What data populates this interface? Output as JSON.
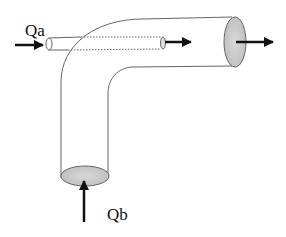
{
  "diagram": {
    "labels": {
      "inflow_a": "Qa",
      "inflow_b": "Qb"
    },
    "colors": {
      "line": "#555555",
      "end_fill": "#cfcfcf",
      "arrow": "#111111",
      "background": "#ffffff"
    },
    "elements": [
      {
        "id": "main-pipe",
        "type": "elbow-pipe",
        "description": "90-degree bend, vertical inlet at bottom, horizontal outlet at right"
      },
      {
        "id": "small-pipe",
        "type": "inner-pipe",
        "description": "thin pipe entering from left, passing through bend (dotted inside)"
      },
      {
        "id": "arrow-qa",
        "type": "arrow",
        "direction": "right",
        "label": "Qa"
      },
      {
        "id": "arrow-qb",
        "type": "arrow",
        "direction": "up",
        "label": "Qb"
      },
      {
        "id": "arrow-small-out",
        "type": "arrow",
        "direction": "right"
      },
      {
        "id": "arrow-main-out",
        "type": "arrow",
        "direction": "right"
      }
    ]
  }
}
